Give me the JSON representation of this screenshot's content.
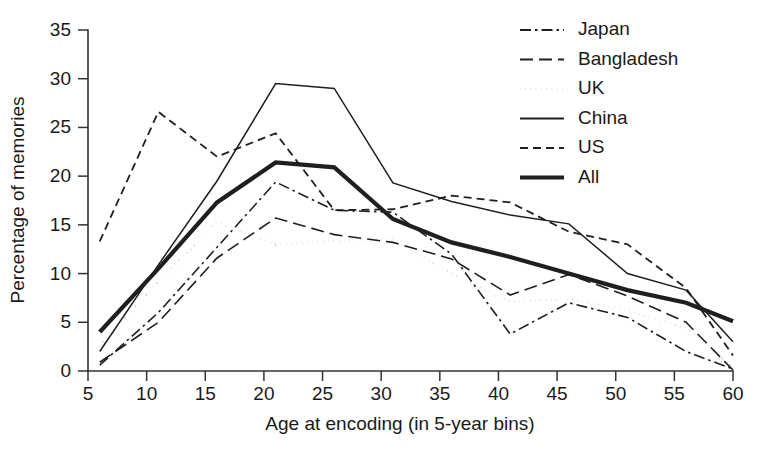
{
  "chart_data": {
    "type": "line",
    "title": "",
    "xlabel": "Age at encoding (in 5-year bins)",
    "ylabel": "Percentage of memories",
    "xlim": [
      5,
      60
    ],
    "ylim": [
      0,
      35
    ],
    "xticks": [
      5,
      10,
      15,
      20,
      25,
      30,
      35,
      40,
      45,
      50,
      55,
      60
    ],
    "yticks": [
      0,
      5,
      10,
      15,
      20,
      25,
      30,
      35
    ],
    "xtick_labels": [
      "5",
      "10",
      "15",
      "20",
      "25",
      "30",
      "35",
      "40",
      "45",
      "50",
      "55",
      "60"
    ],
    "ytick_labels": [
      "0",
      "5",
      "10",
      "15",
      "20",
      "25",
      "30",
      "35"
    ],
    "grid": false,
    "legend_position": "top-right",
    "x": [
      6,
      11,
      16,
      21,
      26,
      31,
      36,
      41,
      46,
      51,
      56,
      60
    ],
    "series": [
      {
        "name": "Japan",
        "style": "dashdot",
        "width": 1.6,
        "values": [
          0.6,
          6.0,
          12.7,
          19.4,
          16.5,
          16.3,
          12.0,
          3.8,
          7.0,
          5.5,
          2.0,
          0.2
        ]
      },
      {
        "name": "Bangladesh",
        "style": "longdash",
        "width": 1.6,
        "values": [
          0.9,
          5.0,
          11.6,
          15.7,
          14.0,
          13.2,
          11.5,
          7.8,
          9.9,
          7.7,
          5.0,
          0.1
        ]
      },
      {
        "name": "UK",
        "style": "dotted",
        "width": 2.6,
        "values": [
          2.6,
          9.2,
          15.3,
          13.0,
          13.4,
          13.5,
          10.0,
          7.1,
          7.4,
          6.2,
          4.4,
          0.4
        ]
      },
      {
        "name": "China",
        "style": "solid",
        "width": 1.5,
        "values": [
          2.0,
          10.9,
          19.5,
          29.5,
          29.0,
          19.3,
          17.4,
          16.0,
          15.1,
          10.0,
          8.3,
          3.0
        ]
      },
      {
        "name": "US",
        "style": "dash",
        "width": 1.8,
        "values": [
          13.3,
          26.6,
          22.0,
          24.4,
          16.5,
          16.6,
          18.0,
          17.3,
          14.3,
          13.0,
          8.5,
          1.6
        ]
      },
      {
        "name": "All",
        "style": "solid",
        "width": 4.2,
        "values": [
          4.0,
          10.5,
          17.3,
          21.4,
          20.9,
          15.6,
          13.2,
          11.7,
          10.0,
          8.3,
          7.0,
          5.1
        ]
      }
    ],
    "legend_entries": [
      {
        "label": "Japan",
        "style": "dashdot"
      },
      {
        "label": "Bangladesh",
        "style": "longdash"
      },
      {
        "label": "UK",
        "style": "dotted"
      },
      {
        "label": "China",
        "style": "solid"
      },
      {
        "label": "US",
        "style": "dash"
      },
      {
        "label": "All",
        "style": "solid-thick"
      }
    ],
    "colors": {
      "line": "#1f1f1f",
      "axis": "#333333",
      "text": "#1a1a1a",
      "background": "#ffffff"
    }
  }
}
